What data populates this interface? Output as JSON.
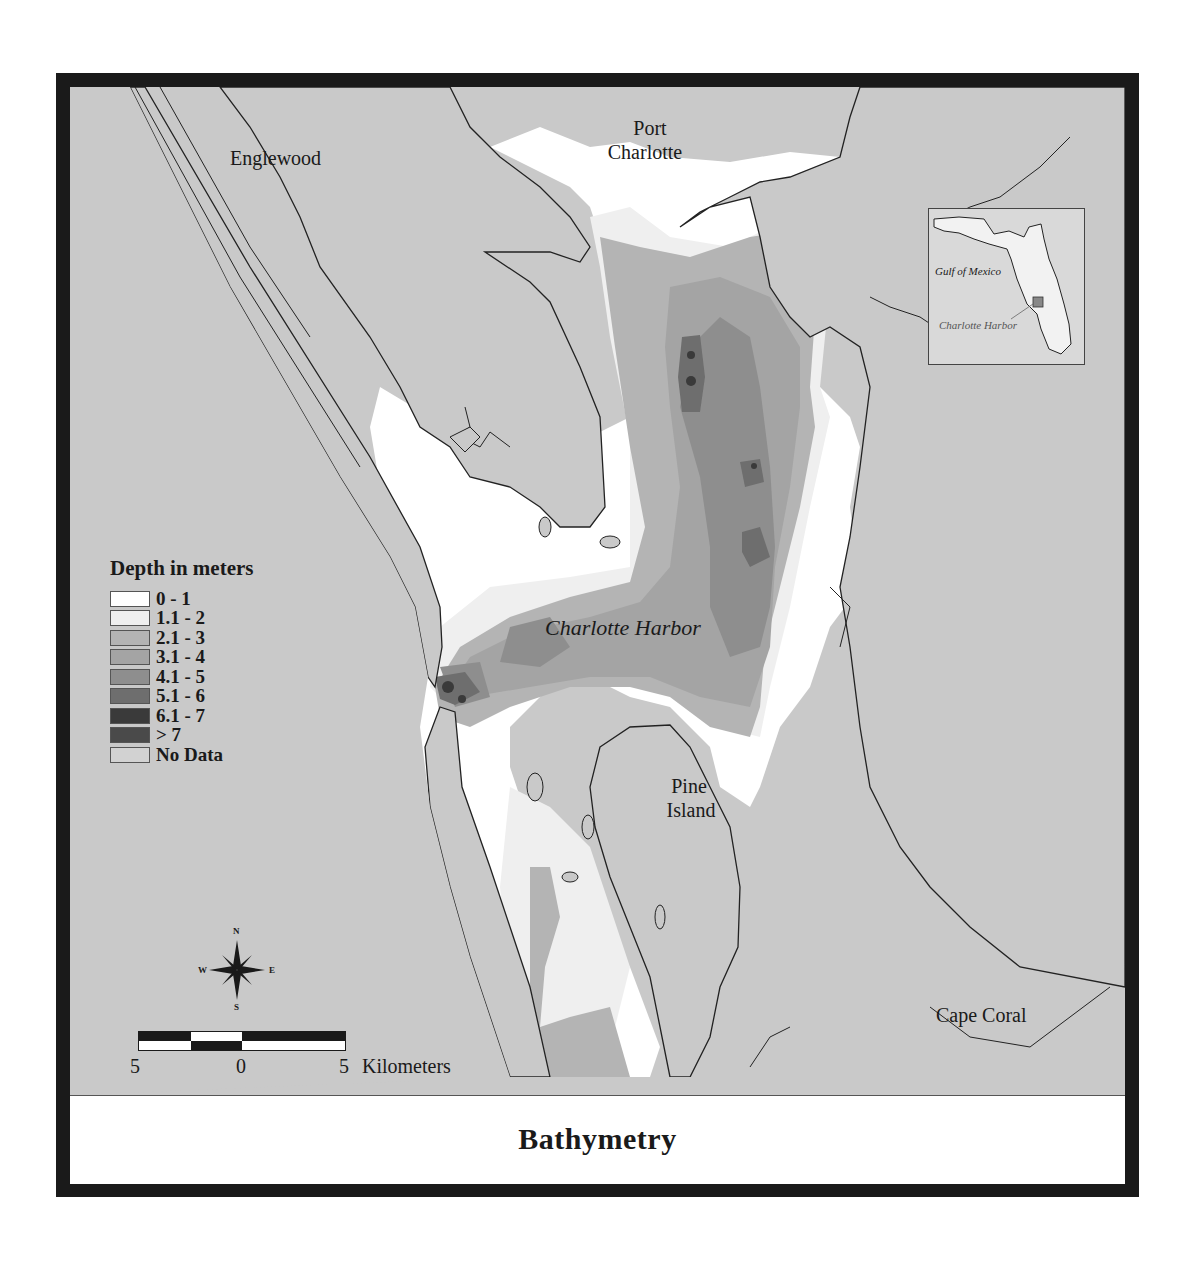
{
  "figure": {
    "title": "Bathymetry",
    "frame_color": "#1a1a1a",
    "land_color": "#c9c9c9"
  },
  "places": {
    "englewood": "Englewood",
    "port_charlotte_line1": "Port",
    "port_charlotte_line2": "Charlotte",
    "charlotte_harbor": "Charlotte Harbor",
    "pine_island_line1": "Pine",
    "pine_island_line2": "Island",
    "cape_coral": "Cape Coral"
  },
  "legend": {
    "title": "Depth in meters",
    "items": [
      {
        "label": "0 - 1",
        "color": "#ffffff"
      },
      {
        "label": "1.1 - 2",
        "color": "#efefef"
      },
      {
        "label": "2.1 - 3",
        "color": "#b4b4b4"
      },
      {
        "label": "3.1 - 4",
        "color": "#a4a4a4"
      },
      {
        "label": "4.1 - 5",
        "color": "#8e8e8e"
      },
      {
        "label": "5.1 - 6",
        "color": "#6e6e6e"
      },
      {
        "label": "6.1 - 7",
        "color": "#3a3a3a"
      },
      {
        "label": "> 7",
        "color": "#4a4a4a"
      },
      {
        "label": "No Data",
        "color": "#d2d2d2"
      }
    ]
  },
  "inset": {
    "gulf_label": "Gulf of Mexico",
    "harbor_label": "Charlotte Harbor"
  },
  "compass": {
    "n": "N",
    "s": "S",
    "e": "E",
    "w": "W"
  },
  "scale": {
    "left": "5",
    "center": "0",
    "right": "5",
    "unit": "Kilometers"
  }
}
